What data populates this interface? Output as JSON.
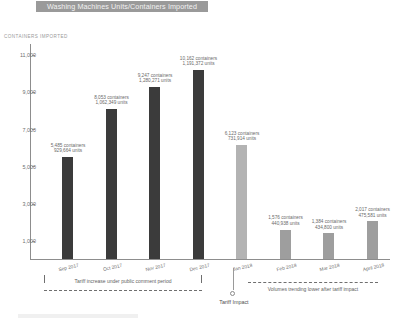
{
  "title": "Washing Machines Units/Containers Imported",
  "axis_caption": "CONTAINERS IMPORTED",
  "annotations": {
    "comment_period": "Tariff increase under public comment period",
    "trend_note": "Volumes trending lower after tariff impact",
    "tariff_impact": "Tariff Impact"
  },
  "colors": {
    "bar_dark": "#3b3b3b",
    "bar_light": "#b3b3b3",
    "bar_mid": "#9e9e9e",
    "axis": "#8d8d8d",
    "title_band": "#9a9a9a"
  },
  "chart_data": {
    "type": "bar",
    "title": "Washing Machines Units/Containers Imported",
    "xlabel": "",
    "ylabel": "CONTAINERS IMPORTED",
    "ylim": [
      0,
      11600
    ],
    "yticks": [
      "1,000",
      "3,000",
      "5,000",
      "7,000",
      "9,000",
      "11,000"
    ],
    "ytick_values": [
      1000,
      3000,
      5000,
      7000,
      9000,
      11000
    ],
    "grid": false,
    "legend": "none",
    "categories": [
      "Sep 2017",
      "Oct 2017",
      "Nov 2017",
      "Dec 2017",
      "Jan 2018",
      "Feb 2018",
      "Mar 2018",
      "April 2018"
    ],
    "values": [
      5485,
      8053,
      9247,
      10162,
      6123,
      1576,
      1384,
      2017
    ],
    "bars": [
      {
        "category": "Sep 2017",
        "containers": 5485,
        "units": 929664,
        "label_line1": "5,485 containers",
        "label_line2": "929,664 units",
        "highlight": false
      },
      {
        "category": "Oct 2017",
        "containers": 8053,
        "units": 1062349,
        "label_line1": "8,053 containers",
        "label_line2": "1,062,349 units",
        "highlight": false
      },
      {
        "category": "Nov 2017",
        "containers": 9247,
        "units": 1280271,
        "label_line1": "9,247 containers",
        "label_line2": "1,280,271 units",
        "highlight": false
      },
      {
        "category": "Dec 2017",
        "containers": 10162,
        "units": 1191372,
        "label_line1": "10,162 containers",
        "label_line2": "1,191,372 units",
        "highlight": false
      },
      {
        "category": "Jan 2018",
        "containers": 6123,
        "units": 731914,
        "label_line1": "6,123 containers",
        "label_line2": "731,914 units",
        "highlight": true
      },
      {
        "category": "Feb 2018",
        "containers": 1576,
        "units": 440938,
        "label_line1": "1,576 containers",
        "label_line2": "440,938 units",
        "highlight": true
      },
      {
        "category": "Mar 2018",
        "containers": 1384,
        "units": 434800,
        "label_line1": "1,384 containers",
        "label_line2": "434,800 units",
        "highlight": true
      },
      {
        "category": "April 2018",
        "containers": 2017,
        "units": 475581,
        "label_line1": "2,017 containers",
        "label_line2": "475,581 units",
        "highlight": true
      }
    ],
    "annotations": [
      "Tariff increase under public comment period",
      "Tariff Impact",
      "Volumes trending lower after tariff impact"
    ]
  }
}
